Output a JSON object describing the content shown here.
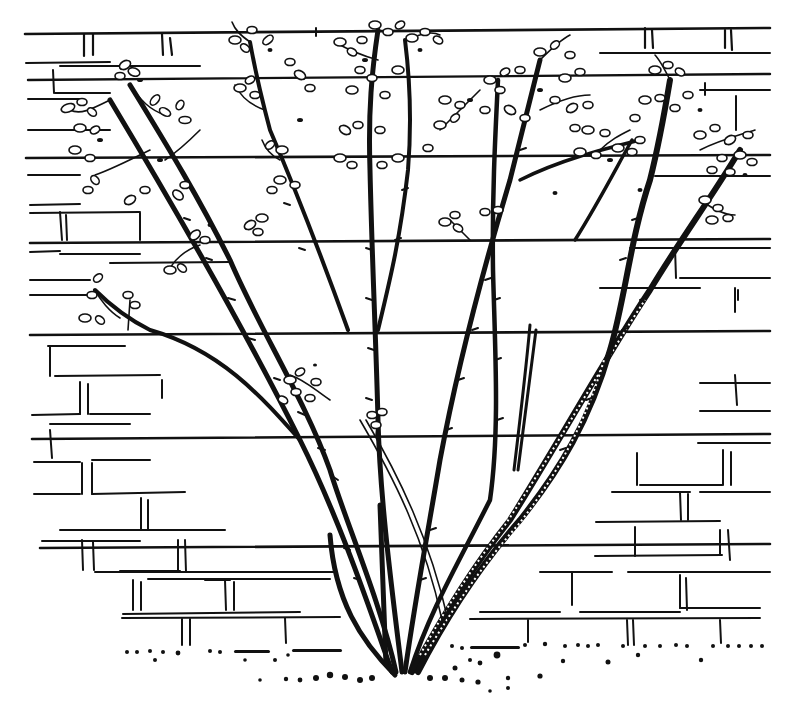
{
  "illustration": {
    "subject": "Shrub with multiple thorny stems trained against a brick wall",
    "style": "black pen-and-ink line drawing on white",
    "top_caption_visible_text": "",
    "top_caption_note": "Caption text at top edge is cropped and illegible",
    "colors": {
      "ink": "#111111",
      "paper": "#ffffff"
    },
    "elements": {
      "wall": "Brick wall drawn with long horizontal course lines and short vertical joints",
      "shrub": "Eight main stems radiating from a single base, with thorns and small leaf clusters at the tips",
      "ground": "Dotted soil/pebble line along the base of the wall"
    }
  }
}
